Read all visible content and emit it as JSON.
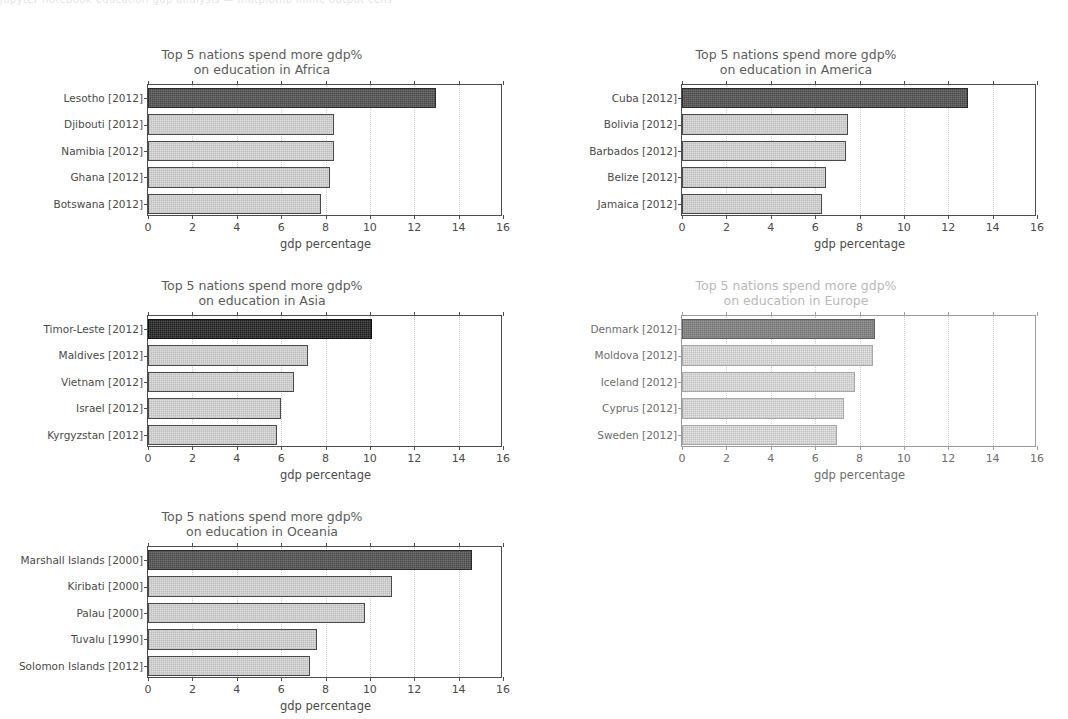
{
  "top_strip": {
    "ghost_text": "jupyter notebook education gdp analysis  —  matplotlib inline output cells"
  },
  "axis": {
    "xlabel": "gdp percentage",
    "ticks": [
      0,
      2,
      4,
      6,
      8,
      10,
      12,
      14,
      16
    ],
    "xlim": [
      0,
      16
    ]
  },
  "chart_data": [
    {
      "type": "bar",
      "orientation": "horizontal",
      "title": "Top 5 nations spend more gdp%\non education in Africa",
      "region": "Africa",
      "xlabel": "gdp percentage",
      "ylabel": "",
      "xlim": [
        0,
        16
      ],
      "grid": true,
      "legend": "none",
      "highlight_index": 0,
      "categories": [
        "Lesotho [2012]",
        "Djibouti [2012]",
        "Namibia [2012]",
        "Ghana [2012]",
        "Botswana [2012]"
      ],
      "values": [
        13.0,
        8.4,
        8.4,
        8.2,
        7.8
      ]
    },
    {
      "type": "bar",
      "orientation": "horizontal",
      "title": "Top 5 nations spend more gdp%\non education in America",
      "region": "America",
      "xlabel": "gdp percentage",
      "ylabel": "",
      "xlim": [
        0,
        16
      ],
      "grid": true,
      "legend": "none",
      "highlight_index": 0,
      "categories": [
        "Cuba [2012]",
        "Bolivia [2012]",
        "Barbados [2012]",
        "Belize [2012]",
        "Jamaica [2012]"
      ],
      "values": [
        12.9,
        7.5,
        7.4,
        6.5,
        6.3
      ]
    },
    {
      "type": "bar",
      "orientation": "horizontal",
      "title": "Top 5 nations spend more gdp%\non education in Asia",
      "region": "Asia",
      "xlabel": "gdp percentage",
      "ylabel": "",
      "xlim": [
        0,
        16
      ],
      "grid": true,
      "legend": "none",
      "highlight_index": 0,
      "categories": [
        "Timor-Leste [2012]",
        "Maldives [2012]",
        "Vietnam [2012]",
        "Israel [2012]",
        "Kyrgyzstan [2012]"
      ],
      "values": [
        10.1,
        7.2,
        6.6,
        6.0,
        5.8
      ]
    },
    {
      "type": "bar",
      "orientation": "horizontal",
      "title": "Top 5 nations spend more gdp%\non education in Europe",
      "region": "Europe",
      "xlabel": "gdp percentage",
      "ylabel": "",
      "xlim": [
        0,
        16
      ],
      "grid": true,
      "legend": "none",
      "highlight_index": 0,
      "faded": true,
      "categories": [
        "Denmark [2012]",
        "Moldova [2012]",
        "Iceland [2012]",
        "Cyprus [2012]",
        "Sweden [2012]"
      ],
      "values": [
        8.7,
        8.6,
        7.8,
        7.3,
        7.0
      ]
    },
    {
      "type": "bar",
      "orientation": "horizontal",
      "title": "Top 5 nations spend more gdp%\non education in Oceania",
      "region": "Oceania",
      "xlabel": "gdp percentage",
      "ylabel": "",
      "xlim": [
        0,
        16
      ],
      "grid": true,
      "legend": "none",
      "highlight_index": 0,
      "categories": [
        "Marshall Islands [2000]",
        "Kiribati [2000]",
        "Palau [2000]",
        "Tuvalu [1990]",
        "Solomon Islands [2012]"
      ],
      "values": [
        14.6,
        11.0,
        9.8,
        7.6,
        7.3
      ]
    }
  ]
}
